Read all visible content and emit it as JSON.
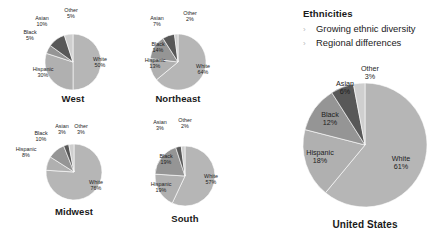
{
  "sidebar_text": {
    "heading": "Ethnicities",
    "bullet_glyph": "›",
    "bullets": [
      "Growing ethnic diversity",
      "Regional differences"
    ]
  },
  "colors": {
    "white_slice": "#b6b6b6",
    "hispanic_slice": "#b0b0b0",
    "black_slice": "#959595",
    "asian_slice": "#585858",
    "other_slice": "#cfcfcf",
    "text": "#1c1c1c",
    "chevron": "#b9b9b9",
    "background": "#ffffff"
  },
  "chart_data": [
    {
      "type": "pie",
      "title": "West",
      "categories": [
        "White",
        "Hispanic",
        "Black",
        "Asian",
        "Other"
      ],
      "values": [
        50,
        30,
        5,
        10,
        5
      ],
      "labels": [
        {
          "name": "White",
          "pct": "50%"
        },
        {
          "name": "Hispanic",
          "pct": "30%"
        },
        {
          "name": "Black",
          "pct": "5%"
        },
        {
          "name": "Asian",
          "pct": "10%"
        },
        {
          "name": "Other",
          "pct": "5%"
        }
      ]
    },
    {
      "type": "pie",
      "title": "Northeast",
      "categories": [
        "White",
        "Hispanic",
        "Black",
        "Asian",
        "Other"
      ],
      "values": [
        64,
        13,
        14,
        7,
        2
      ],
      "labels": [
        {
          "name": "White",
          "pct": "64%"
        },
        {
          "name": "Hispanic",
          "pct": "13%"
        },
        {
          "name": "Black",
          "pct": "14%"
        },
        {
          "name": "Asian",
          "pct": "7%"
        },
        {
          "name": "Other",
          "pct": "2%"
        }
      ]
    },
    {
      "type": "pie",
      "title": "Midwest",
      "categories": [
        "White",
        "Hispanic",
        "Black",
        "Asian",
        "Other"
      ],
      "values": [
        76,
        8,
        10,
        3,
        3
      ],
      "labels": [
        {
          "name": "White",
          "pct": "76%"
        },
        {
          "name": "Hispanic",
          "pct": "8%"
        },
        {
          "name": "Black",
          "pct": "10%"
        },
        {
          "name": "Asian",
          "pct": "3%"
        },
        {
          "name": "Other",
          "pct": "3%"
        }
      ]
    },
    {
      "type": "pie",
      "title": "South",
      "categories": [
        "White",
        "Hispanic",
        "Black",
        "Asian",
        "Other"
      ],
      "values": [
        57,
        19,
        19,
        3,
        2
      ],
      "labels": [
        {
          "name": "White",
          "pct": "57%"
        },
        {
          "name": "Hispanic",
          "pct": "19%"
        },
        {
          "name": "Black",
          "pct": "19%"
        },
        {
          "name": "Asian",
          "pct": "3%"
        },
        {
          "name": "Other",
          "pct": "2%"
        }
      ]
    },
    {
      "type": "pie",
      "title": "United States",
      "categories": [
        "White",
        "Hispanic",
        "Black",
        "Asian",
        "Other"
      ],
      "values": [
        61,
        18,
        12,
        6,
        3
      ],
      "labels": [
        {
          "name": "White",
          "pct": "61%"
        },
        {
          "name": "Hispanic",
          "pct": "18%"
        },
        {
          "name": "Black",
          "pct": "12%"
        },
        {
          "name": "Asian",
          "pct": "6%"
        },
        {
          "name": "Other",
          "pct": "3%"
        }
      ]
    }
  ],
  "layout": {
    "pies": [
      {
        "key": "west",
        "cx": 73,
        "cy": 62,
        "r": 28,
        "title_y": 93,
        "label_positions": [
          {
            "lx": 100,
            "ly": 63
          },
          {
            "lx": 43,
            "ly": 73
          },
          {
            "lx": 30,
            "ly": 36
          },
          {
            "lx": 42,
            "ly": 22
          },
          {
            "lx": 71,
            "ly": 14
          }
        ]
      },
      {
        "key": "northeast",
        "cx": 178,
        "cy": 62,
        "r": 28,
        "title_y": 93,
        "label_positions": [
          {
            "lx": 203,
            "ly": 70
          },
          {
            "lx": 155,
            "ly": 64
          },
          {
            "lx": 158,
            "ly": 48
          },
          {
            "lx": 157,
            "ly": 22
          },
          {
            "lx": 190,
            "ly": 17
          }
        ]
      },
      {
        "key": "midwest",
        "cx": 74,
        "cy": 172,
        "r": 28,
        "title_y": 206,
        "label_positions": [
          {
            "lx": 96,
            "ly": 186
          },
          {
            "lx": 26,
            "ly": 153
          },
          {
            "lx": 41,
            "ly": 137
          },
          {
            "lx": 62,
            "ly": 130
          },
          {
            "lx": 81,
            "ly": 130
          }
        ]
      },
      {
        "key": "south",
        "cx": 185,
        "cy": 176,
        "r": 30,
        "title_y": 213,
        "label_positions": [
          {
            "lx": 211,
            "ly": 180
          },
          {
            "lx": 161,
            "ly": 188
          },
          {
            "lx": 166,
            "ly": 160
          },
          {
            "lx": 160,
            "ly": 126
          },
          {
            "lx": 185,
            "ly": 124
          }
        ]
      },
      {
        "key": "united-states",
        "cx": 365,
        "cy": 145,
        "r": 62,
        "title_y": 219,
        "label_positions": [
          {
            "lx": 401,
            "ly": 163
          },
          {
            "lx": 320,
            "ly": 157
          },
          {
            "lx": 330,
            "ly": 119
          },
          {
            "lx": 345,
            "ly": 88
          },
          {
            "lx": 370,
            "ly": 73
          }
        ]
      }
    ],
    "start_angle_deg": 0
  }
}
